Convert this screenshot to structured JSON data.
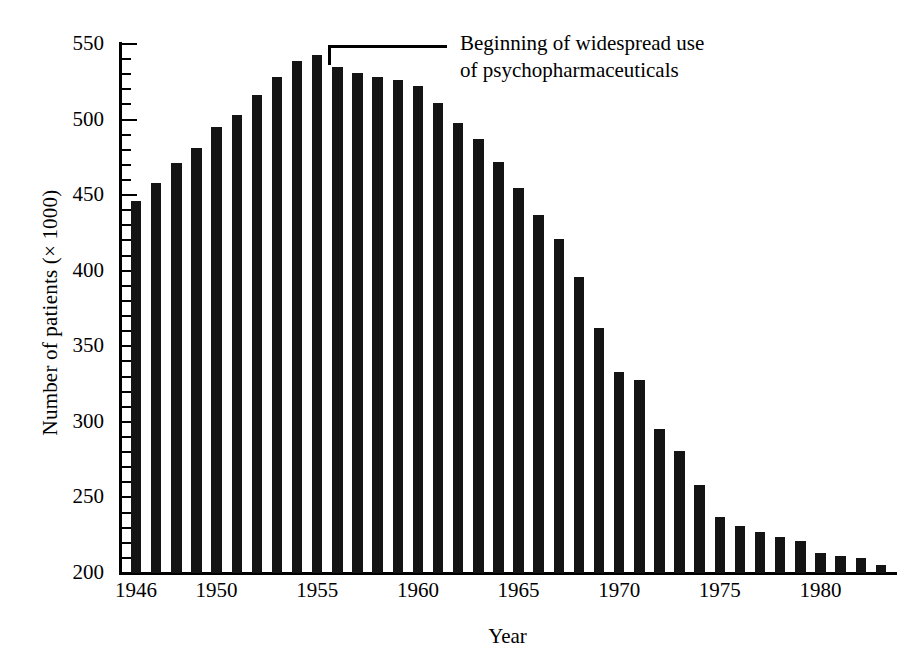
{
  "chart_data": {
    "type": "bar",
    "title": "",
    "xlabel": "Year",
    "ylabel": "Number of patients (× 1000)",
    "ylim": [
      200,
      560
    ],
    "xlim": [
      1945.2,
      1983.8
    ],
    "grid": false,
    "legend": null,
    "y_major_ticks": [
      200,
      250,
      300,
      350,
      400,
      450,
      500,
      550
    ],
    "y_minor_tick_step": 10,
    "x_tick_labels": [
      "1946",
      "1950",
      "1955",
      "1960",
      "1965",
      "1970",
      "1975",
      "1980"
    ],
    "x_tick_values": [
      1946,
      1950,
      1955,
      1960,
      1965,
      1970,
      1975,
      1980
    ],
    "bar_color": "#141414",
    "categories": [
      1946,
      1947,
      1948,
      1949,
      1950,
      1951,
      1952,
      1953,
      1954,
      1955,
      1956,
      1957,
      1958,
      1959,
      1960,
      1961,
      1962,
      1963,
      1964,
      1965,
      1966,
      1967,
      1968,
      1969,
      1970,
      1971,
      1972,
      1973,
      1974,
      1975,
      1976,
      1977,
      1978,
      1979,
      1980,
      1981,
      1982,
      1983
    ],
    "values": [
      446,
      458,
      471,
      481,
      495,
      503,
      516,
      528,
      539,
      543,
      535,
      531,
      528,
      526,
      522,
      511,
      498,
      487,
      472,
      455,
      437,
      421,
      396,
      362,
      333,
      328,
      295,
      281,
      258,
      237,
      231,
      227,
      224,
      221,
      213,
      211,
      210,
      205
    ],
    "annotations": [
      {
        "text": "Beginning of widespread use\nof psychopharmaceuticals",
        "points_to_year": 1956,
        "style": "bracket-with-leader"
      }
    ]
  }
}
